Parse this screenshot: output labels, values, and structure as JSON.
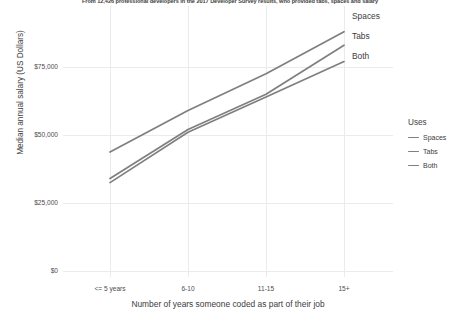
{
  "chart_data": {
    "type": "line",
    "title": "",
    "subtitle": "From 12,426 professional developers in the 2017 Developer Survey results, who provided tabs, spaces and salary",
    "xlabel": "Number of years someone coded as part of their job",
    "ylabel": "Median annual salary (US Dollars)",
    "categories": [
      "<= 5 years",
      "6-10",
      "11-15",
      "15+"
    ],
    "series": [
      {
        "name": "Spaces",
        "values": [
          43750,
          59000,
          72500,
          88000
        ],
        "color": "#7f7f7f"
      },
      {
        "name": "Tabs",
        "values": [
          34000,
          52000,
          65000,
          83000
        ],
        "color": "#7f7f7f"
      },
      {
        "name": "Both",
        "values": [
          32500,
          51000,
          64000,
          77000
        ],
        "color": "#7f7f7f"
      }
    ],
    "ylim": [
      0,
      92000
    ],
    "yticks": [
      0,
      25000,
      50000,
      75000
    ],
    "ytick_labels": [
      "$0",
      "$25,000",
      "$50,000",
      "$75,000"
    ],
    "grid": true,
    "grid_color": "#ebebeb",
    "legend_position": "right",
    "background_color": "#ffffff"
  },
  "legend": {
    "title": "Uses",
    "items": [
      {
        "label": "Spaces"
      },
      {
        "label": "Tabs"
      },
      {
        "label": "Both"
      }
    ]
  },
  "end_labels": [
    {
      "label": "Spaces"
    },
    {
      "label": "Tabs"
    },
    {
      "label": "Both"
    }
  ]
}
